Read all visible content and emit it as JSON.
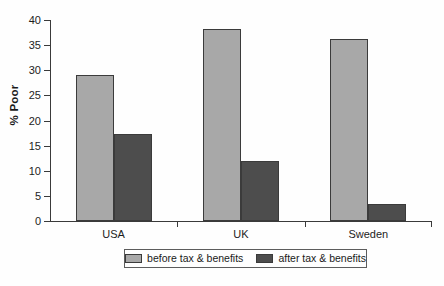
{
  "chart_data": {
    "type": "bar",
    "title": "",
    "xlabel": "",
    "ylabel": "% Poor",
    "ylim": [
      0,
      40
    ],
    "yticks": [
      0,
      5,
      10,
      15,
      20,
      25,
      30,
      35,
      40
    ],
    "grid": false,
    "legend_position": "bottom",
    "categories": [
      "USA",
      "UK",
      "Sweden"
    ],
    "series": [
      {
        "name": "before tax & benefits",
        "color": "#a8a8a8",
        "values": [
          29.0,
          38.2,
          36.2
        ]
      },
      {
        "name": "after tax & benefits",
        "color": "#4d4d4d",
        "values": [
          17.3,
          12.0,
          3.4
        ]
      }
    ]
  },
  "axis": {
    "y_label": "% Poor",
    "tick_labels": [
      "40",
      "35",
      "30",
      "25",
      "20",
      "15",
      "10",
      "5",
      "0"
    ]
  },
  "legend": {
    "entries": [
      {
        "label": "before tax & benefits"
      },
      {
        "label": "after tax & benefits"
      }
    ]
  },
  "caption": {
    "text": ""
  }
}
